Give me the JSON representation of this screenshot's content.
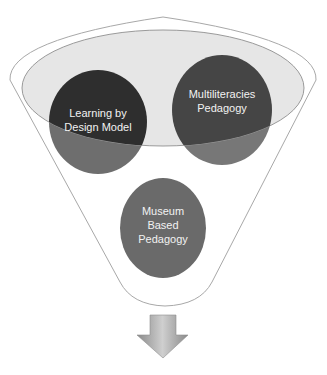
{
  "diagram": {
    "type": "funnel",
    "circles": [
      {
        "id": "learning-by-design",
        "lines": [
          "Learning by",
          "Design Model"
        ],
        "color": "#2e2e2e"
      },
      {
        "id": "multiliteracies",
        "lines": [
          "Multiliteracies",
          "Pedagogy"
        ],
        "color": "#454545"
      },
      {
        "id": "museum-based",
        "lines": [
          "Museum",
          "Based",
          "Pedagogy"
        ],
        "color": "#6a6a6a"
      }
    ],
    "colors": {
      "funnel_outline": "#a8a8a8",
      "funnel_top_fill": "#e6e6e6",
      "arrow": "#a0a0a0",
      "background": "#ffffff"
    },
    "output_arrow": "down-arrow"
  }
}
